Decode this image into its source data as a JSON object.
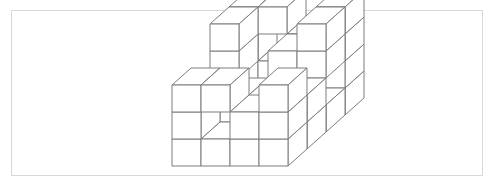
{
  "figure": {
    "kind": "line-drawing",
    "background_color": "#ffffff",
    "frame": {
      "border_color": "#d8d8d8",
      "border_width_px": 1,
      "x": 11,
      "y": 10,
      "width": 472,
      "height": 166
    },
    "stroke_color": "#7d7d7d",
    "fill_color": "#ffffff",
    "stroke_width_px": 1
  },
  "projection": {
    "type": "isometric-axonometric",
    "cube_face_width_px": 29,
    "cube_face_height_px": 27,
    "depth_dx_px": 19,
    "depth_dy_px": -17,
    "origin_x_px": 172,
    "origin_y_px": 166,
    "grid_dims": {
      "x": 4,
      "y": 4,
      "z": 4
    },
    "axis_notes": "x = right along front face, y = depth (up-right), z = vertical up"
  },
  "chart_data": {
    "type": "scatter",
    "xlabel": "x (columns)",
    "ylabel": "z (levels)",
    "cubes": [
      [
        0,
        0,
        0
      ],
      [
        1,
        0,
        0
      ],
      [
        2,
        0,
        0
      ],
      [
        3,
        0,
        0
      ],
      [
        0,
        1,
        0
      ],
      [
        2,
        1,
        0
      ],
      [
        3,
        1,
        0
      ],
      [
        0,
        2,
        0
      ],
      [
        1,
        2,
        0
      ],
      [
        3,
        2,
        0
      ],
      [
        0,
        3,
        0
      ],
      [
        1,
        3,
        0
      ],
      [
        2,
        3,
        0
      ],
      [
        3,
        3,
        0
      ],
      [
        0,
        0,
        1
      ],
      [
        2,
        0,
        1
      ],
      [
        3,
        0,
        1
      ],
      [
        0,
        1,
        1
      ],
      [
        1,
        1,
        1
      ],
      [
        3,
        1,
        1
      ],
      [
        0,
        3,
        1
      ],
      [
        1,
        3,
        1
      ],
      [
        3,
        3,
        1
      ],
      [
        0,
        0,
        2
      ],
      [
        1,
        0,
        2
      ],
      [
        3,
        0,
        2
      ],
      [
        0,
        2,
        2
      ],
      [
        2,
        2,
        2
      ],
      [
        3,
        2,
        2
      ],
      [
        0,
        3,
        2
      ],
      [
        2,
        3,
        2
      ],
      [
        3,
        3,
        2
      ],
      [
        0,
        3,
        3
      ],
      [
        1,
        3,
        3
      ],
      [
        3,
        3,
        3
      ],
      [
        0,
        2,
        3
      ],
      [
        3,
        2,
        3
      ]
    ],
    "cube_count": 37
  }
}
